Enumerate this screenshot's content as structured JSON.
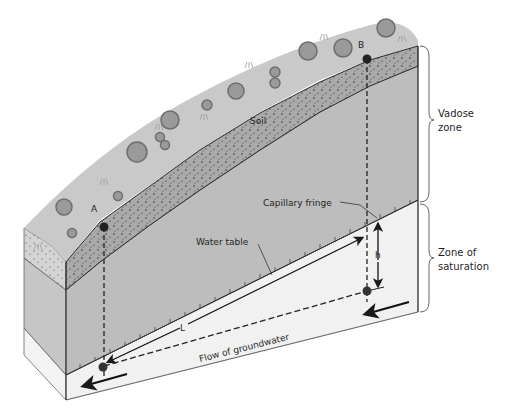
{
  "labels": {
    "soil": "Soil",
    "point_a": "A",
    "point_b": "B",
    "water_table": "Water table",
    "capillary_fringe": "Capillary fringe",
    "h": "h",
    "L": "L",
    "flow": "Flow of groundwater",
    "vadose_line1": "Vadose",
    "vadose_line2": "zone",
    "saturation_line1": "Zone of",
    "saturation_line2": "saturation"
  },
  "colors": {
    "surface": "#c9c9c9",
    "vegetation": "#8e8e8e",
    "soil": "#a9a9a9",
    "vadose": "#bdbdbd",
    "vadose_side": "#c8c8c8",
    "saturated": "#f1f1f1",
    "line": "#2a2a2a"
  }
}
